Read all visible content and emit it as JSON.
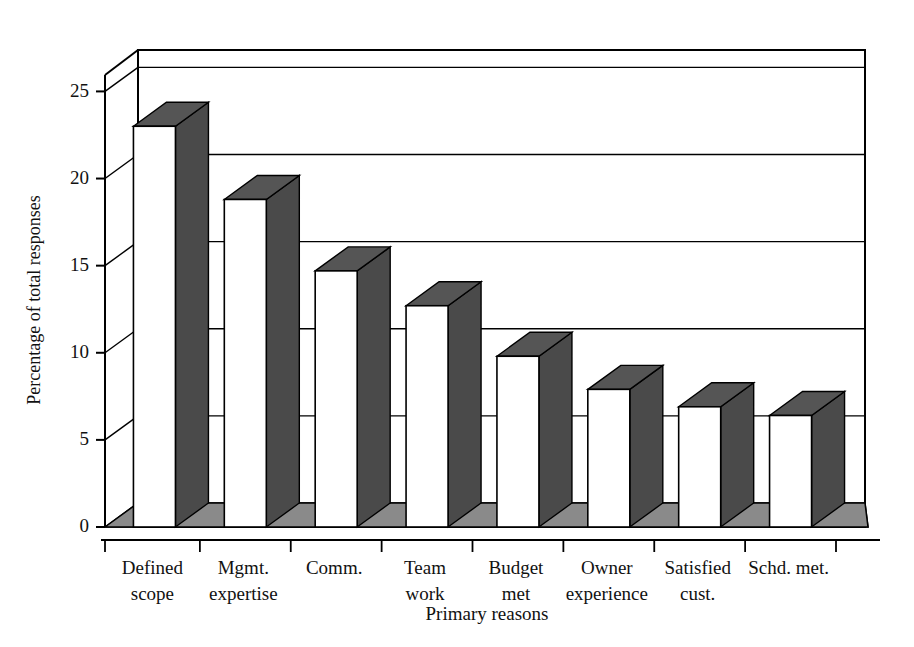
{
  "chart_data": {
    "type": "bar",
    "title": "",
    "subtitle": "",
    "xlabel": "Primary reasons",
    "ylabel": "Percentage of total responses",
    "categories": [
      "Defined scope",
      "Mgmt. expertise",
      "Comm.",
      "Team work",
      "Budget met",
      "Owner experience",
      "Satisfied cust.",
      "Schd. met."
    ],
    "category_lines": [
      [
        "Defined",
        "scope"
      ],
      [
        "Mgmt.",
        "expertise"
      ],
      [
        "Comm.",
        ""
      ],
      [
        "Team",
        "work"
      ],
      [
        "Budget",
        "met"
      ],
      [
        "Owner",
        "experience"
      ],
      [
        "Satisfied",
        "cust."
      ],
      [
        "Schd. met.",
        ""
      ]
    ],
    "values": [
      23.0,
      18.8,
      14.7,
      12.7,
      9.8,
      7.9,
      6.9,
      6.4
    ],
    "ylim": [
      0,
      26
    ],
    "yticks": [
      0,
      5,
      10,
      15,
      20,
      25
    ],
    "ytick_labels": [
      "0",
      "5",
      "10",
      "15",
      "20",
      "25"
    ],
    "grid": true,
    "grid_orientation": "horizontal",
    "legend": false,
    "legend_position": "none",
    "style": "3d-column",
    "bar_face_color": "#ffffff",
    "bar_side_color": "#4a4a4a",
    "bar_top_color": "#555555",
    "floor_color": "#8a8a8a",
    "outline_color": "#000000",
    "background_color": "#ffffff"
  },
  "axes": {
    "y_title": "Percentage of total responses",
    "x_title": "Primary reasons"
  }
}
